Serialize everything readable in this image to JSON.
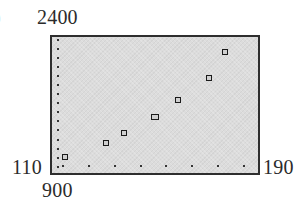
{
  "chart_data": {
    "type": "scatter",
    "title": "",
    "xlabel": "",
    "ylabel": "",
    "xlim": [
      110,
      190
    ],
    "ylim": [
      900,
      2400
    ],
    "x_tick_spacing": 10,
    "y_tick_spacing": 100,
    "grid": false,
    "window_labels": {
      "xmin": "110",
      "xmax": "190",
      "ymin": "900",
      "ymax": "2400"
    },
    "series": [
      {
        "name": "data",
        "marker": "square",
        "points": [
          {
            "x": 115,
            "y": 1075
          },
          {
            "x": 131,
            "y": 1230
          },
          {
            "x": 138,
            "y": 1340
          },
          {
            "x": 150,
            "y": 1520
          },
          {
            "x": 159,
            "y": 1705
          },
          {
            "x": 171,
            "y": 1950
          },
          {
            "x": 177,
            "y": 2235
          }
        ]
      }
    ]
  },
  "labels": {
    "ymax": "2400",
    "xmin": "110",
    "xmax": "190",
    "ymin": "900"
  },
  "colors": {
    "plot_background": "#dcdcdc",
    "frame": "#2e2e2e",
    "marker": "#1a1a1a"
  }
}
